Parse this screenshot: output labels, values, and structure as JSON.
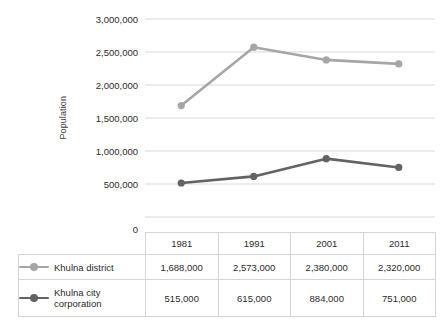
{
  "chart_data": {
    "type": "line",
    "title": "",
    "xlabel": "",
    "ylabel": "Population",
    "categories": [
      "1981",
      "1991",
      "2001",
      "2011"
    ],
    "ylim": [
      0,
      3000000
    ],
    "ytick_labels": [
      "3,000,000",
      "2,500,000",
      "2,000,000",
      "1,500,000",
      "1,000,000",
      "500,000",
      "0"
    ],
    "ytick_values": [
      3000000,
      2500000,
      2000000,
      1500000,
      1000000,
      500000,
      0
    ],
    "grid": true,
    "legend_position": "data-table-left",
    "series": [
      {
        "name": "Khulna district",
        "color": "#a6a6a6",
        "values": [
          1688000,
          2573000,
          2380000,
          2320000
        ],
        "labels": [
          "1,688,000",
          "2,573,000",
          "2,380,000",
          "2,320,000"
        ]
      },
      {
        "name": "Khulna city corporation",
        "color": "#636363",
        "values": [
          515000,
          615000,
          884000,
          751000
        ],
        "labels": [
          "515,000",
          "615,000",
          "884,000",
          "751,000"
        ]
      }
    ]
  },
  "table": {
    "corner_label": "",
    "year_headers": [
      "1981",
      "1991",
      "2001",
      "2011"
    ],
    "rows": [
      {
        "legend_name": "Khulna district",
        "legend_line_1": "Khulna district",
        "legend_line_2": "",
        "swatch_color": "#a6a6a6",
        "cells": [
          "1,688,000",
          "2,573,000",
          "2,380,000",
          "2,320,000"
        ]
      },
      {
        "legend_name": "Khulna city corporation",
        "legend_line_1": "Khulna city",
        "legend_line_2": "corporation",
        "swatch_color": "#636363",
        "cells": [
          "515,000",
          "615,000",
          "884,000",
          "751,000"
        ]
      }
    ]
  },
  "colors": {
    "series_light": "#a6a6a6",
    "series_dark": "#636363",
    "gridline": "#d9d9d9",
    "table_border": "#d4d4d4",
    "text": "#2b2b2b",
    "background": "#ffffff"
  }
}
